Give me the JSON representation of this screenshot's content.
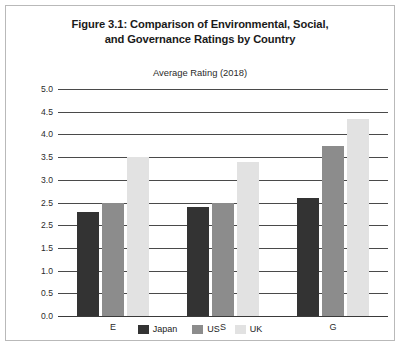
{
  "figure": {
    "title_line1": "Figure 3.1: Comparison of Environmental, Social,",
    "title_line2": "and Governance Ratings by Country",
    "subtitle": "Average Rating (2018)"
  },
  "legend": {
    "items": [
      {
        "label": "Japan",
        "color": "#333333"
      },
      {
        "label": "US",
        "color": "#8c8c8c"
      },
      {
        "label": "UK",
        "color": "#e2e2e2"
      }
    ]
  },
  "chart_data": {
    "type": "bar",
    "title": "Figure 3.1: Comparison of Environmental, Social, and Governance Ratings by Country",
    "subtitle": "Average Rating (2018)",
    "xlabel": "",
    "ylabel": "Average Rating (2018)",
    "categories": [
      "E",
      "S",
      "G"
    ],
    "series": [
      {
        "name": "Japan",
        "color": "#333333",
        "values": [
          2.3,
          2.4,
          2.6
        ]
      },
      {
        "name": "US",
        "color": "#8c8c8c",
        "values": [
          2.5,
          2.5,
          3.75
        ]
      },
      {
        "name": "UK",
        "color": "#e2e2e2",
        "values": [
          3.5,
          3.4,
          4.35
        ]
      }
    ],
    "ylim": [
      0.0,
      5.0
    ],
    "ytick_step": 0.5,
    "ytick_labels": [
      "5.0",
      "4.5",
      "4.0",
      "3.5",
      "3.0",
      "2.5",
      "2.5",
      "1.5",
      "1.0",
      "0.5",
      "0.0"
    ],
    "ytick_values": [
      5.0,
      4.5,
      4.0,
      3.5,
      3.0,
      2.5,
      2.0,
      1.5,
      1.0,
      0.5,
      0.0
    ],
    "grid": true,
    "legend_position": "bottom"
  }
}
